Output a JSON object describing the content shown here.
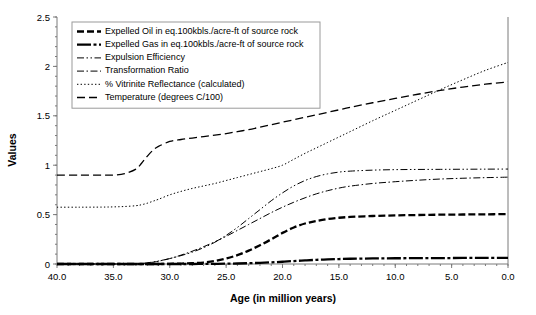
{
  "chart_data": {
    "type": "line",
    "title": "",
    "xlabel": "Age (in million years)",
    "ylabel": "Values",
    "xlim": [
      40.0,
      0.0
    ],
    "ylim": [
      0,
      2.5
    ],
    "x_reversed": true,
    "grid": false,
    "legend_position": "top-left",
    "xticks": [
      "40.0",
      "35.0",
      "30.0",
      "25.0",
      "20.0",
      "15.0",
      "10.0",
      "5.0",
      "0.0"
    ],
    "xtick_values": [
      40.0,
      35.0,
      30.0,
      25.0,
      20.0,
      15.0,
      10.0,
      5.0,
      0.0
    ],
    "yticks": [
      "0",
      "0.5",
      "1",
      "1.5",
      "2",
      "2.5"
    ],
    "ytick_values": [
      0,
      0.5,
      1,
      1.5,
      2,
      2.5
    ],
    "x": [
      40,
      38,
      36,
      35,
      34,
      33,
      32.5,
      32,
      31.5,
      31,
      30,
      29,
      28,
      27,
      26,
      25,
      24,
      23,
      22,
      21,
      20,
      19,
      18,
      17,
      16,
      15,
      14,
      12,
      10,
      8,
      6,
      4,
      2,
      0
    ],
    "series": [
      {
        "name": "Expelled Oil in eq.100kbls./acre-ft of source rock",
        "dash": "thick-dashed",
        "values": [
          0,
          0,
          0,
          0,
          0,
          0,
          0,
          0,
          0,
          0,
          0.002,
          0.004,
          0.008,
          0.015,
          0.03,
          0.055,
          0.09,
          0.135,
          0.19,
          0.25,
          0.315,
          0.37,
          0.41,
          0.435,
          0.455,
          0.468,
          0.476,
          0.486,
          0.492,
          0.496,
          0.499,
          0.501,
          0.503,
          0.505
        ]
      },
      {
        "name": "Expelled Gas in eq.100kbls./acre-ft of source rock",
        "dash": "thick-solid",
        "values": [
          0,
          0,
          0,
          0,
          0,
          0,
          0,
          0,
          0,
          0,
          0,
          0,
          0,
          0.001,
          0.002,
          0.003,
          0.005,
          0.008,
          0.012,
          0.017,
          0.023,
          0.03,
          0.036,
          0.042,
          0.046,
          0.05,
          0.053,
          0.056,
          0.058,
          0.059,
          0.06,
          0.061,
          0.062,
          0.063
        ]
      },
      {
        "name": "Expulsion Efficiency",
        "dash": "dash-dot-dot",
        "values": [
          0,
          0,
          0,
          0,
          0,
          0,
          0.005,
          0.012,
          0.02,
          0.03,
          0.055,
          0.085,
          0.12,
          0.165,
          0.22,
          0.29,
          0.37,
          0.46,
          0.55,
          0.64,
          0.72,
          0.79,
          0.845,
          0.885,
          0.912,
          0.93,
          0.94,
          0.95,
          0.955,
          0.957,
          0.958,
          0.959,
          0.96,
          0.961
        ]
      },
      {
        "name": "Transformation Ratio",
        "dash": "dash-dot",
        "values": [
          0,
          0,
          0,
          0,
          0,
          0.002,
          0.005,
          0.01,
          0.018,
          0.028,
          0.055,
          0.09,
          0.13,
          0.175,
          0.225,
          0.28,
          0.34,
          0.4,
          0.46,
          0.52,
          0.575,
          0.625,
          0.67,
          0.71,
          0.742,
          0.768,
          0.788,
          0.815,
          0.833,
          0.848,
          0.86,
          0.868,
          0.874,
          0.879
        ]
      },
      {
        "name": "% Vitrinite Reflectance (calculated)",
        "dash": "dotted",
        "values": [
          0.575,
          0.575,
          0.576,
          0.578,
          0.582,
          0.59,
          0.6,
          0.615,
          0.635,
          0.655,
          0.7,
          0.735,
          0.765,
          0.79,
          0.815,
          0.845,
          0.875,
          0.905,
          0.935,
          0.965,
          1.0,
          1.06,
          1.12,
          1.175,
          1.23,
          1.285,
          1.34,
          1.45,
          1.555,
          1.66,
          1.765,
          1.865,
          1.96,
          2.04
        ]
      },
      {
        "name": "Temperature (degrees C/100)",
        "dash": "long-dashed",
        "values": [
          0.9,
          0.9,
          0.9,
          0.9,
          0.915,
          0.96,
          1.02,
          1.09,
          1.15,
          1.19,
          1.24,
          1.26,
          1.275,
          1.29,
          1.305,
          1.32,
          1.34,
          1.36,
          1.385,
          1.41,
          1.435,
          1.46,
          1.485,
          1.51,
          1.535,
          1.56,
          1.585,
          1.632,
          1.676,
          1.718,
          1.757,
          1.791,
          1.82,
          1.843
        ]
      }
    ]
  },
  "legend": {
    "items": [
      "Expelled Oil in eq.100kbls./acre-ft of source rock",
      "Expelled Gas in eq.100kbls./acre-ft of source rock",
      "Expulsion Efficiency",
      "Transformation Ratio",
      "% Vitrinite Reflectance (calculated)",
      "Temperature (degrees C/100)"
    ]
  },
  "colors": {
    "line": "#000000",
    "axis": "#7a7a7a",
    "background": "#ffffff",
    "legend_border": "#9a9a9a"
  }
}
